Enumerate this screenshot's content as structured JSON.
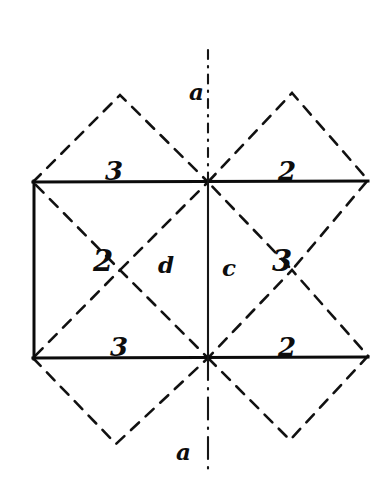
{
  "figure": {
    "background_color": "#ffffff",
    "ink_color": "#0d0d0d",
    "canvas": {
      "width": 370,
      "height": 501
    },
    "axis": {
      "name": "vertical-axis",
      "style": "dash-dot",
      "x": 208,
      "y_top": 50,
      "y_bottom": 470,
      "label_top": "a",
      "label_bottom": "a"
    },
    "rectangle": {
      "name": "solid-rectangle",
      "style": "solid",
      "left": 33,
      "right": 365,
      "top": 182,
      "bottom": 358
    },
    "horizontal_lines": [
      {
        "name": "top-horizontal-line",
        "y": 182,
        "x1": 33,
        "x2": 368
      },
      {
        "name": "bottom-horizontal-line",
        "y": 358,
        "x1": 33,
        "x2": 368
      }
    ],
    "center_point": {
      "x": 208,
      "y": 270
    },
    "diamonds": [
      {
        "name": "upper-left-diamond",
        "apex": {
          "x": 120,
          "y": 95
        }
      },
      {
        "name": "upper-right-diamond",
        "apex": {
          "x": 292,
          "y": 93
        }
      },
      {
        "name": "lower-left-diamond",
        "apex": {
          "x": 116,
          "y": 444
        }
      },
      {
        "name": "lower-right-diamond",
        "apex": {
          "x": 290,
          "y": 440
        }
      }
    ],
    "labels": [
      {
        "id": "label-a-top",
        "text": "a",
        "kind": "letter",
        "x": 189,
        "y": 80
      },
      {
        "id": "label-3-top-left",
        "text": "3",
        "kind": "number",
        "x": 105,
        "y": 158
      },
      {
        "id": "label-2-top-right",
        "text": "2",
        "kind": "number",
        "x": 278,
        "y": 158
      },
      {
        "id": "label-2-mid-left",
        "text": "2",
        "kind": "number-big",
        "x": 93,
        "y": 247
      },
      {
        "id": "label-d-mid",
        "text": "d",
        "kind": "letter",
        "x": 158,
        "y": 253
      },
      {
        "id": "label-c-mid",
        "text": "c",
        "kind": "letter",
        "x": 222,
        "y": 256
      },
      {
        "id": "label-3-mid-right",
        "text": "3",
        "kind": "number-big",
        "x": 272,
        "y": 247
      },
      {
        "id": "label-3-bottom-left",
        "text": "3",
        "kind": "number",
        "x": 110,
        "y": 334
      },
      {
        "id": "label-2-bottom-right",
        "text": "2",
        "kind": "number",
        "x": 278,
        "y": 334
      },
      {
        "id": "label-a-bottom",
        "text": "a",
        "kind": "letter",
        "x": 176,
        "y": 440
      }
    ]
  }
}
